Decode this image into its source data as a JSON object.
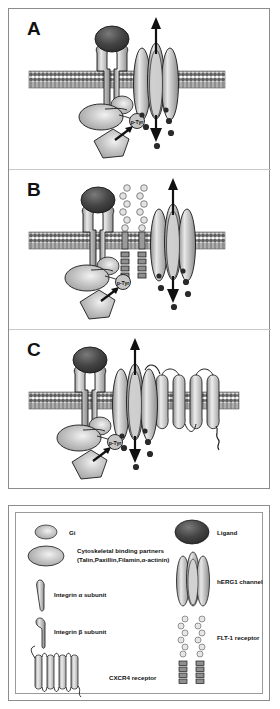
{
  "figure": {
    "panels": [
      {
        "id": "A",
        "label": "A",
        "description": "Integrin bound to ligand, hERG1 channel, Gi and cytoskeletal binding partners with p-Tyr signalling",
        "annotations": {
          "ptyr": "p-Tyr"
        },
        "components": [
          "ligand",
          "integrin-alpha",
          "integrin-beta",
          "membrane",
          "hERG1-channel",
          "cytoskeletal-partners",
          "Gi",
          "p-Tyr",
          "ions"
        ]
      },
      {
        "id": "B",
        "label": "B",
        "description": "Integrin and hERG1 channel complexed with FLT-1 receptor",
        "annotations": {
          "ptyr": "p-Tyr"
        },
        "components": [
          "ligand",
          "integrin-alpha",
          "integrin-beta",
          "membrane",
          "FLT-1-receptor",
          "hERG1-channel",
          "cytoskeletal-partners",
          "Gi",
          "p-Tyr",
          "ions"
        ]
      },
      {
        "id": "C",
        "label": "C",
        "description": "Integrin and hERG1 channel complexed with CXCR4 receptor",
        "annotations": {
          "ptyr": "p-Tyr"
        },
        "components": [
          "ligand",
          "integrin-alpha",
          "integrin-beta",
          "membrane",
          "hERG1-channel",
          "CXCR4-receptor",
          "cytoskeletal-partners",
          "Gi",
          "p-Tyr",
          "ions"
        ]
      }
    ]
  },
  "legend": {
    "items": [
      {
        "key": "gi",
        "label": "Gi",
        "symbol": "small-gray-ellipse",
        "column": "left"
      },
      {
        "key": "cytoskeletal",
        "label": "Cytoskeletal binding partners",
        "sublabel": "(Talin,Paxillin,Filamin,α-actinin)",
        "symbol": "large-gray-ellipse",
        "column": "left"
      },
      {
        "key": "integrin-alpha",
        "label": "Integrin α  subunit",
        "symbol": "alpha-subunit-shape",
        "column": "left"
      },
      {
        "key": "integrin-beta",
        "label": "Integrin β  subunit",
        "symbol": "beta-subunit-shape",
        "column": "left"
      },
      {
        "key": "cxcr4",
        "label": "CXCR4 receptor",
        "symbol": "seven-helix-serpentine",
        "column": "left"
      },
      {
        "key": "ligand",
        "label": "Ligand",
        "symbol": "dark-ellipse",
        "column": "right"
      },
      {
        "key": "herg1",
        "label": "hERG1 channel",
        "symbol": "four-ellipse-bundle",
        "column": "right"
      },
      {
        "key": "flt1",
        "label": "FLT-1 receptor",
        "symbol": "beaded-ig-domain-chain",
        "column": "right"
      }
    ]
  },
  "colors": {
    "frame_border": "#8c8c8c",
    "membrane": "#6e6e6e",
    "ligand_dark": "#3b3b3b",
    "protein_gray": "#b9b9b9",
    "protein_light": "#d8d8d8",
    "ion_dark": "#2a2a2a",
    "outline": "#1a1a1a",
    "background": "#ffffff"
  }
}
